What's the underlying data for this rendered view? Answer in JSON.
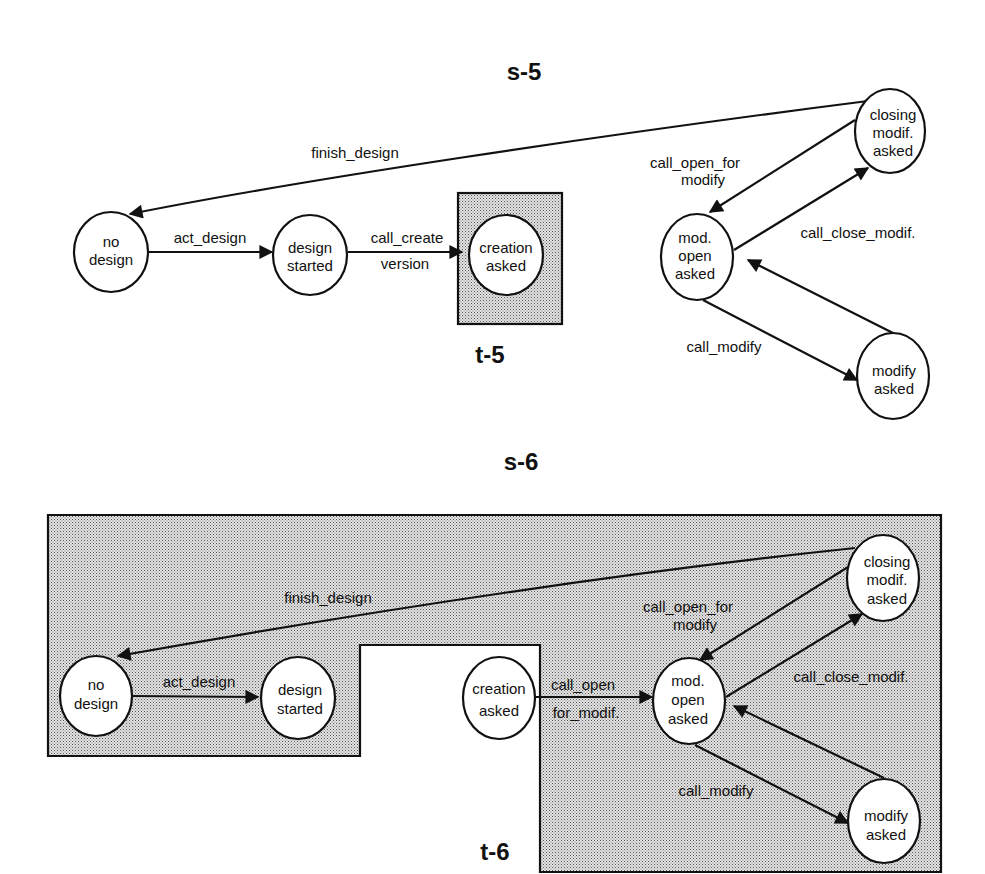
{
  "diagrams": {
    "s5": {
      "title": "s-5",
      "region_label": "t-5",
      "nodes": {
        "no_design": [
          "no",
          "design"
        ],
        "design_started": [
          "design",
          "started"
        ],
        "creation_asked": [
          "creation",
          "asked"
        ],
        "mod_open_asked": [
          "mod.",
          "open",
          "asked"
        ],
        "closing_modif_asked": [
          "closing",
          "modif.",
          "asked"
        ],
        "modify_asked": [
          "modify",
          "asked"
        ]
      },
      "edges": {
        "finish_design": "finish_design",
        "act_design": "act_design",
        "call_create_1": "call_create",
        "call_create_2": "version",
        "call_open_for_modify_1": "call_open_for",
        "call_open_for_modify_2": "modify",
        "call_close_modif": "call_close_modif.",
        "call_modify": "call_modify"
      }
    },
    "s6": {
      "title": "s-6",
      "region_label": "t-6",
      "nodes": {
        "no_design": [
          "no",
          "design"
        ],
        "design_started": [
          "design",
          "started"
        ],
        "creation_asked": [
          "creation",
          "asked"
        ],
        "mod_open_asked": [
          "mod.",
          "open",
          "asked"
        ],
        "closing_modif_asked": [
          "closing",
          "modif.",
          "asked"
        ],
        "modify_asked": [
          "modify",
          "asked"
        ]
      },
      "edges": {
        "finish_design": "finish_design",
        "act_design": "act_design",
        "call_open_for_modif_1": "call_open",
        "call_open_for_modif_2": "for_modif.",
        "call_open_for_modify_1": "call_open_for",
        "call_open_for_modify_2": "modify",
        "call_close_modif": "call_close_modif.",
        "call_modify": "call_modify"
      }
    }
  }
}
